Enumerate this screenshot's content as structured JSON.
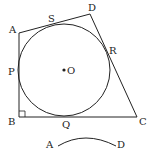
{
  "diagram": {
    "points": {
      "A": {
        "label": "A",
        "x": 19,
        "y": 33
      },
      "B": {
        "label": "B",
        "x": 19,
        "y": 117
      },
      "C": {
        "label": "C",
        "x": 137,
        "y": 117
      },
      "D": {
        "label": "D",
        "x": 90,
        "y": 14
      },
      "O": {
        "label": "O",
        "x": 64,
        "y": 70
      }
    },
    "tangent_points": {
      "P": {
        "label": "P"
      },
      "Q": {
        "label": "Q"
      },
      "R": {
        "label": "R"
      },
      "S": {
        "label": "S"
      }
    },
    "circle": {
      "cx": 64,
      "cy": 70,
      "r": 46
    },
    "right_angle_at": "B",
    "second_figure": {
      "labels": {
        "A": "A",
        "D": "D"
      }
    },
    "colors": {
      "stroke": "#222222",
      "background": "#ffffff"
    }
  }
}
